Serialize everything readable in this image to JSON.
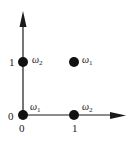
{
  "diagram": {
    "axes": {
      "x_ticks": [
        "0",
        "1"
      ],
      "y_ticks": [
        "0",
        "1"
      ]
    },
    "points": [
      {
        "x": 0,
        "y": 0,
        "class_symbol": "ω",
        "class_index": "1"
      },
      {
        "x": 1,
        "y": 0,
        "class_symbol": "ω",
        "class_index": "2"
      },
      {
        "x": 0,
        "y": 1,
        "class_symbol": "ω",
        "class_index": "2"
      },
      {
        "x": 1,
        "y": 1,
        "class_symbol": "ω",
        "class_index": "1"
      }
    ],
    "colors": {
      "ink": "#1a1a1a",
      "background": "#ffffff"
    }
  }
}
